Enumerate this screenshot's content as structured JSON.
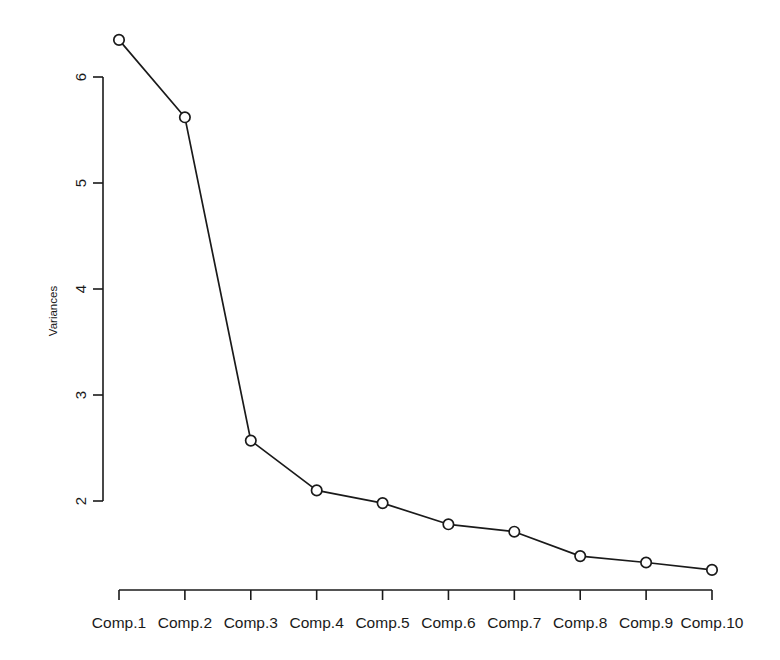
{
  "chart_data": {
    "type": "line",
    "title": "",
    "subtitle": "",
    "xlabel": "",
    "ylabel": "Variances",
    "categories": [
      "Comp.1",
      "Comp.2",
      "Comp.3",
      "Comp.4",
      "Comp.5",
      "Comp.6",
      "Comp.7",
      "Comp.8",
      "Comp.9",
      "Comp.10"
    ],
    "values": [
      6.35,
      5.62,
      2.57,
      2.1,
      1.98,
      1.78,
      1.71,
      1.48,
      1.42,
      1.35
    ],
    "series": [
      {
        "name": "Variances",
        "values": [
          6.35,
          5.62,
          2.57,
          2.1,
          1.98,
          1.78,
          1.71,
          1.48,
          1.42,
          1.35
        ]
      }
    ],
    "y_ticks": [
      2,
      3,
      4,
      5,
      6
    ],
    "y_tick_labels": [
      "2",
      "3",
      "4",
      "5",
      "6"
    ],
    "ylim": [
      1.28,
      6.45
    ],
    "y_axis_range_drawn": [
      2,
      6
    ],
    "xlim": [
      0.5,
      10.5
    ],
    "grid": false,
    "legend": false,
    "legend_position": "none",
    "marker": "open-circle",
    "line_color": "#1a1a1a",
    "marker_fill": "#ffffff",
    "background": "#ffffff",
    "annotations": []
  },
  "plot": {
    "y_axis_label": "Variances",
    "y_tick_labels": [
      "2",
      "3",
      "4",
      "5",
      "6"
    ],
    "x_tick_labels": [
      "Comp.1",
      "Comp.2",
      "Comp.3",
      "Comp.4",
      "Comp.5",
      "Comp.6",
      "Comp.7",
      "Comp.8",
      "Comp.9",
      "Comp.10"
    ]
  }
}
